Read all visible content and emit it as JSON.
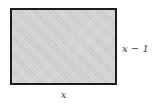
{
  "diagram": {
    "type": "geometry-figure",
    "shape": "rectangle",
    "fill_color": "#d2d2d2",
    "border_color": "#1c1c1c",
    "background_color": "#ffffff",
    "label_color": "#3a3a3a",
    "labels": {
      "height": "x − 1",
      "width": "x"
    }
  }
}
